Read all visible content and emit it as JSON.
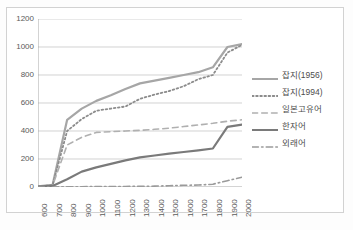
{
  "chart_data": {
    "type": "line",
    "title": "",
    "xlabel": "",
    "ylabel": "",
    "x": [
      600,
      700,
      800,
      900,
      1000,
      1100,
      1200,
      1300,
      1400,
      1500,
      1600,
      1700,
      1800,
      1900,
      2000
    ],
    "categories": [
      "600",
      "700",
      "800",
      "900",
      "1000",
      "1100",
      "1200",
      "1300",
      "1400",
      "1500",
      "1600",
      "1700",
      "1800",
      "1900",
      "2000"
    ],
    "xlim": [
      600,
      2000
    ],
    "ylim": [
      0,
      1200
    ],
    "yticks": [
      0,
      200,
      400,
      600,
      800,
      1000,
      1200
    ],
    "grid": "horizontal",
    "legend_position": "right",
    "series": [
      {
        "name": "잡지(1956)",
        "style": "solid",
        "color": "#a6a6a6",
        "width": 2.2,
        "values": [
          5,
          15,
          480,
          560,
          615,
          655,
          700,
          740,
          760,
          780,
          800,
          820,
          855,
          1000,
          1020
        ]
      },
      {
        "name": "잡지(1994)",
        "style": "dotted",
        "color": "#8c8c8c",
        "width": 1.8,
        "values": [
          5,
          12,
          400,
          485,
          545,
          560,
          575,
          630,
          660,
          685,
          720,
          770,
          800,
          960,
          1015
        ]
      },
      {
        "name": "일본고유어",
        "style": "dashed",
        "color": "#b0b0b0",
        "width": 1.6,
        "values": [
          5,
          10,
          300,
          355,
          390,
          395,
          400,
          405,
          412,
          420,
          432,
          443,
          455,
          470,
          480
        ]
      },
      {
        "name": "한자어",
        "style": "solid",
        "color": "#7a7a7a",
        "width": 2.2,
        "values": [
          2,
          8,
          55,
          110,
          140,
          165,
          190,
          212,
          225,
          238,
          250,
          262,
          275,
          430,
          445
        ]
      },
      {
        "name": "외래어",
        "style": "dashdot",
        "color": "#9a9a9a",
        "width": 1.6,
        "values": [
          0,
          0,
          2,
          2,
          3,
          3,
          4,
          5,
          6,
          9,
          12,
          14,
          20,
          45,
          70
        ]
      }
    ]
  },
  "legend": {
    "items": [
      {
        "label": "잡지(1956)"
      },
      {
        "label": "잡지(1994)"
      },
      {
        "label": "일본고유어"
      },
      {
        "label": "한자어"
      },
      {
        "label": "외래어"
      }
    ]
  }
}
